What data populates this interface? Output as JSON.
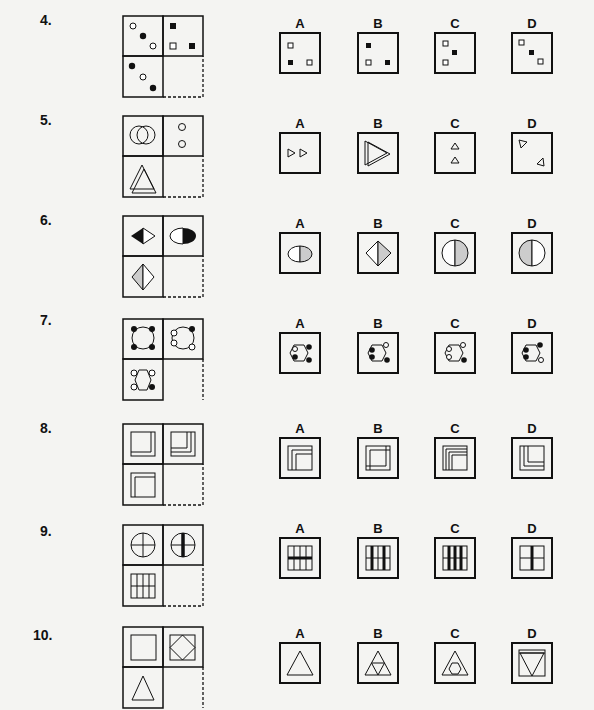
{
  "questions": [
    {
      "number": "4.",
      "options": [
        "A",
        "B",
        "C",
        "D"
      ],
      "description": "Dots/squares pattern: circles to squares"
    },
    {
      "number": "5.",
      "options": [
        "A",
        "B",
        "C",
        "D"
      ],
      "description": "Overlapping shapes split into two separate shapes"
    },
    {
      "number": "6.",
      "options": [
        "A",
        "B",
        "C",
        "D"
      ],
      "description": "Half-shaded shapes rotate to circle"
    },
    {
      "number": "7.",
      "options": [
        "A",
        "B",
        "C",
        "D"
      ],
      "description": "Shape with corner dots, colors swap"
    },
    {
      "number": "8.",
      "options": [
        "A",
        "B",
        "C",
        "D"
      ],
      "description": "Nested square outlines"
    },
    {
      "number": "9.",
      "options": [
        "A",
        "B",
        "C",
        "D"
      ],
      "description": "Grid with thick lines"
    },
    {
      "number": "10.",
      "options": [
        "A",
        "B",
        "C",
        "D"
      ],
      "description": "Shape inscribed in shape"
    }
  ]
}
